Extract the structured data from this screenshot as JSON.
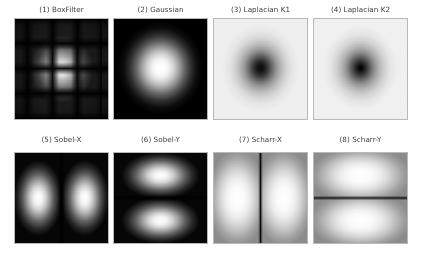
{
  "figure": {
    "background_color": "#ffffff",
    "width": 421,
    "height": 260,
    "title_color": "#3b3b3b",
    "grid_rows": 2,
    "grid_cols": 4
  },
  "panels": [
    {
      "index": 1,
      "title": "(1) BoxFilter",
      "filter_name": "BoxFilter",
      "pattern": "periodic-grid",
      "background": "dark",
      "center_brightness": "bright",
      "description_text": "sinc-like periodic grid of dark nulls with bright center lobe"
    },
    {
      "index": 2,
      "title": "(2) Gaussian",
      "filter_name": "Gaussian",
      "pattern": "radial-blob",
      "background": "dark",
      "center_brightness": "bright",
      "description_text": "smooth bright radial blob on black background"
    },
    {
      "index": 3,
      "title": "(3) Laplacian K1",
      "filter_name": "Laplacian K1",
      "pattern": "inverse-radial-blob",
      "background": "light",
      "center_brightness": "dark",
      "description_text": "dark radial core fading to light background"
    },
    {
      "index": 4,
      "title": "(4) Laplacian K2",
      "filter_name": "Laplacian K2",
      "pattern": "inverse-radial-blob",
      "background": "light",
      "center_brightness": "dark",
      "description_text": "tighter darker radial core fading to light background"
    },
    {
      "index": 5,
      "title": "(5) Sobel-X",
      "filter_name": "Sobel-X",
      "pattern": "two-vertical-lobes",
      "background": "dark",
      "center_brightness": "dark-vertical-null",
      "description_text": "two bright vertical lobes split by a dark vertical null"
    },
    {
      "index": 6,
      "title": "(6) Sobel-Y",
      "filter_name": "Sobel-Y",
      "pattern": "two-horizontal-lobes",
      "background": "dark",
      "center_brightness": "dark-horizontal-null",
      "description_text": "two bright horizontal lobes split by a dark horizontal null"
    },
    {
      "index": 7,
      "title": "(7) Scharr-X",
      "filter_name": "Scharr-X",
      "pattern": "two-vertical-lobes",
      "background": "light",
      "center_brightness": "dark-vertical-null",
      "description_text": "two broad bright vertical lobes split by a thin dark vertical null"
    },
    {
      "index": 8,
      "title": "(8) Scharr-Y",
      "filter_name": "Scharr-Y",
      "pattern": "two-horizontal-lobes",
      "background": "light",
      "center_brightness": "dark-horizontal-null",
      "description_text": "two broad bright horizontal lobes split by a thin dark horizontal null"
    }
  ],
  "chart_data": {
    "type": "heatmap",
    "title": "",
    "subtitle": "",
    "xlabel": "",
    "ylabel": "",
    "grid": false,
    "legend": null,
    "colormap": "gray",
    "layout": {
      "rows": 2,
      "cols": 4
    },
    "axis_ticks": {
      "x": [],
      "y": []
    },
    "subplot_titles": [
      "(1) BoxFilter",
      "(2) Gaussian",
      "(3) Laplacian K1",
      "(4) Laplacian K2",
      "(5) Sobel-X",
      "(6) Sobel-Y",
      "(7) Scharr-X",
      "(8) Scharr-Y"
    ],
    "series": [
      {
        "name": "(1) BoxFilter",
        "peak_location": "center",
        "peak_value": 1.0,
        "background_value": 0.08,
        "structure": "periodic grid nulls"
      },
      {
        "name": "(2) Gaussian",
        "peak_location": "center",
        "peak_value": 1.0,
        "background_value": 0.0,
        "structure": "single radial lobe"
      },
      {
        "name": "(3) Laplacian K1",
        "peak_location": "edges",
        "peak_value": 0.94,
        "background_value": 0.94,
        "structure": "dark central null"
      },
      {
        "name": "(4) Laplacian K2",
        "peak_location": "edges",
        "peak_value": 0.95,
        "background_value": 0.95,
        "structure": "tight dark central null"
      },
      {
        "name": "(5) Sobel-X",
        "peak_location": "left and right of center",
        "peak_value": 1.0,
        "background_value": 0.02,
        "structure": "vertical null line"
      },
      {
        "name": "(6) Sobel-Y",
        "peak_location": "above and below center",
        "peak_value": 1.0,
        "background_value": 0.02,
        "structure": "horizontal null line"
      },
      {
        "name": "(7) Scharr-X",
        "peak_location": "left and right of center",
        "peak_value": 1.0,
        "background_value": 0.55,
        "structure": "thin vertical null line"
      },
      {
        "name": "(8) Scharr-Y",
        "peak_location": "above and below center",
        "peak_value": 1.0,
        "background_value": 0.55,
        "structure": "thin horizontal null line"
      }
    ]
  }
}
